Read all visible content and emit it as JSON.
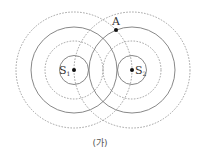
{
  "diagram": {
    "caption": "(가)",
    "sources": [
      {
        "label": "S",
        "subscript": "1",
        "cx": 74,
        "cy": 70
      },
      {
        "label": "S",
        "subscript": "2",
        "cx": 132,
        "cy": 70
      }
    ],
    "wavefronts": {
      "solid_radii": [
        14.5,
        43
      ],
      "dashed_radii": [
        29,
        58
      ]
    },
    "point": {
      "label": "A",
      "x": 116,
      "y": 30
    },
    "colors": {
      "solid": "#7a7a7a",
      "dashed": "#8c8c8c",
      "dot": "#111111"
    }
  }
}
